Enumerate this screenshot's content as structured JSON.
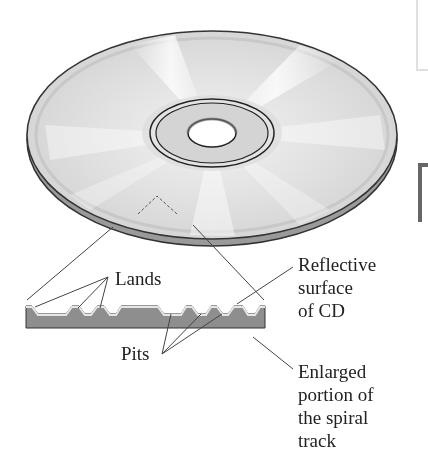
{
  "figure": {
    "labels": {
      "lands": "Lands",
      "pits": "Pits",
      "reflective_surface": [
        "Reflective",
        "surface",
        "of CD"
      ],
      "enlarged_portion": [
        "Enlarged",
        "portion of",
        "the spiral",
        "track"
      ]
    },
    "colors": {
      "disc_light": "#f4f4f4",
      "disc_mid": "#d9d9d9",
      "disc_edge": "#333333",
      "track_fill": "#8e8e8e",
      "reflective_top": "#e6e6e6",
      "leader_line": "#444444",
      "text": "#222222"
    }
  }
}
